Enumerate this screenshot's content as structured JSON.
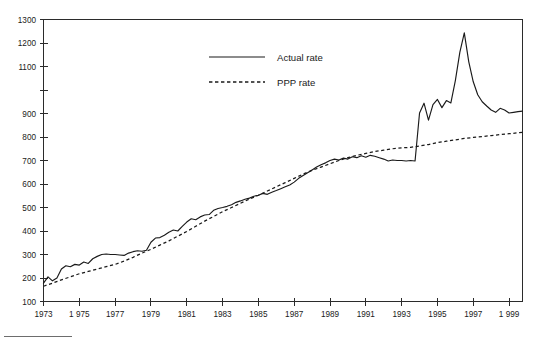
{
  "chart_data": {
    "type": "line",
    "title": "",
    "subtitle": "",
    "xlabel": "",
    "ylabel": "",
    "xlim": [
      1973,
      1999.75
    ],
    "ylim": [
      100,
      1300
    ],
    "grid": false,
    "legend_position": "top-center",
    "x_tick_labels": [
      "1973",
      "1 975",
      "1977",
      "1979",
      "1981",
      "1983",
      "1985",
      "1987",
      "1989",
      "1991",
      "1993",
      "1995",
      "1997",
      "1 999"
    ],
    "x_tick_values": [
      1973,
      1975,
      1977,
      1979,
      1981,
      1983,
      1985,
      1987,
      1989,
      1991,
      1993,
      1995,
      1997,
      1999
    ],
    "y_tick_labels": [
      "1300",
      "1200",
      "1100",
      "900",
      "800",
      "700",
      "600",
      "500",
      "400",
      "300",
      "200",
      "100"
    ],
    "y_tick_values": [
      1300,
      1200,
      1100,
      1000,
      900,
      800,
      700,
      600,
      500,
      400,
      300,
      200,
      100
    ],
    "series": [
      {
        "name": "Actual rate",
        "style": "solid",
        "color": "#1a1a1a",
        "x": [
          1973.0,
          1973.25,
          1973.5,
          1973.75,
          1974.0,
          1974.25,
          1974.5,
          1974.75,
          1975.0,
          1975.25,
          1975.5,
          1975.75,
          1976.0,
          1976.25,
          1976.5,
          1976.75,
          1977.0,
          1977.25,
          1977.5,
          1977.75,
          1978.0,
          1978.25,
          1978.5,
          1978.75,
          1979.0,
          1979.25,
          1979.5,
          1979.75,
          1980.0,
          1980.25,
          1980.5,
          1980.75,
          1981.0,
          1981.25,
          1981.5,
          1981.75,
          1982.0,
          1982.25,
          1982.5,
          1982.75,
          1983.0,
          1983.25,
          1983.5,
          1983.75,
          1984.0,
          1984.25,
          1984.5,
          1984.75,
          1985.0,
          1985.25,
          1985.5,
          1985.75,
          1986.0,
          1986.25,
          1986.5,
          1986.75,
          1987.0,
          1987.25,
          1987.5,
          1987.75,
          1988.0,
          1988.25,
          1988.5,
          1988.75,
          1989.0,
          1989.25,
          1989.5,
          1989.75,
          1990.0,
          1990.25,
          1990.5,
          1990.75,
          1991.0,
          1991.25,
          1991.5,
          1991.75,
          1992.0,
          1992.25,
          1992.5,
          1992.75,
          1993.0,
          1993.25,
          1993.5,
          1993.75,
          1994.0,
          1994.25,
          1994.5,
          1994.75,
          1995.0,
          1995.25,
          1995.5,
          1995.75,
          1996.0,
          1996.25,
          1996.5,
          1996.75,
          1997.0,
          1997.25,
          1997.5,
          1997.75,
          1998.0,
          1998.25,
          1998.5,
          1998.75,
          1999.0,
          1999.25,
          1999.5,
          1999.75
        ],
        "values": [
          178,
          205,
          188,
          200,
          238,
          252,
          248,
          258,
          255,
          268,
          262,
          282,
          292,
          300,
          302,
          300,
          300,
          298,
          296,
          306,
          312,
          316,
          314,
          318,
          352,
          370,
          372,
          382,
          395,
          404,
          400,
          420,
          438,
          452,
          448,
          460,
          468,
          470,
          488,
          496,
          500,
          505,
          512,
          522,
          528,
          535,
          540,
          548,
          552,
          560,
          556,
          565,
          572,
          580,
          588,
          596,
          608,
          624,
          636,
          648,
          660,
          672,
          682,
          690,
          700,
          706,
          702,
          710,
          706,
          716,
          712,
          720,
          714,
          722,
          718,
          712,
          706,
          698,
          702,
          700,
          700,
          698,
          700,
          698,
          902,
          944,
          872,
          938,
          960,
          925,
          955,
          945,
          1040,
          1160,
          1243,
          1120,
          1035,
          980,
          950,
          932,
          915,
          905,
          922,
          915,
          902,
          905,
          908,
          910
        ]
      },
      {
        "name": "PPP rate",
        "style": "dashed",
        "color": "#1a1a1a",
        "x": [
          1973.0,
          1973.5,
          1974.0,
          1974.5,
          1975.0,
          1975.5,
          1976.0,
          1976.5,
          1977.0,
          1977.5,
          1978.0,
          1978.5,
          1979.0,
          1979.5,
          1980.0,
          1980.5,
          1981.0,
          1981.5,
          1982.0,
          1982.5,
          1983.0,
          1983.5,
          1984.0,
          1984.5,
          1985.0,
          1985.5,
          1986.0,
          1986.5,
          1987.0,
          1987.5,
          1988.0,
          1988.5,
          1989.0,
          1989.5,
          1990.0,
          1990.5,
          1991.0,
          1991.5,
          1992.0,
          1992.5,
          1993.0,
          1993.5,
          1994.0,
          1994.5,
          1995.0,
          1995.5,
          1996.0,
          1996.5,
          1997.0,
          1997.5,
          1998.0,
          1998.5,
          1999.0,
          1999.5,
          1999.75
        ],
        "values": [
          165,
          178,
          192,
          205,
          218,
          228,
          238,
          248,
          258,
          272,
          288,
          306,
          322,
          340,
          358,
          378,
          398,
          420,
          442,
          462,
          482,
          500,
          518,
          536,
          552,
          570,
          588,
          606,
          624,
          642,
          658,
          672,
          686,
          700,
          712,
          722,
          730,
          738,
          744,
          750,
          754,
          756,
          762,
          768,
          776,
          782,
          788,
          794,
          798,
          802,
          806,
          810,
          814,
          818,
          820
        ]
      }
    ]
  },
  "legend": {
    "items": [
      {
        "label": "Actual rate",
        "style": "solid"
      },
      {
        "label": "PPP rate",
        "style": "dashed"
      }
    ]
  }
}
